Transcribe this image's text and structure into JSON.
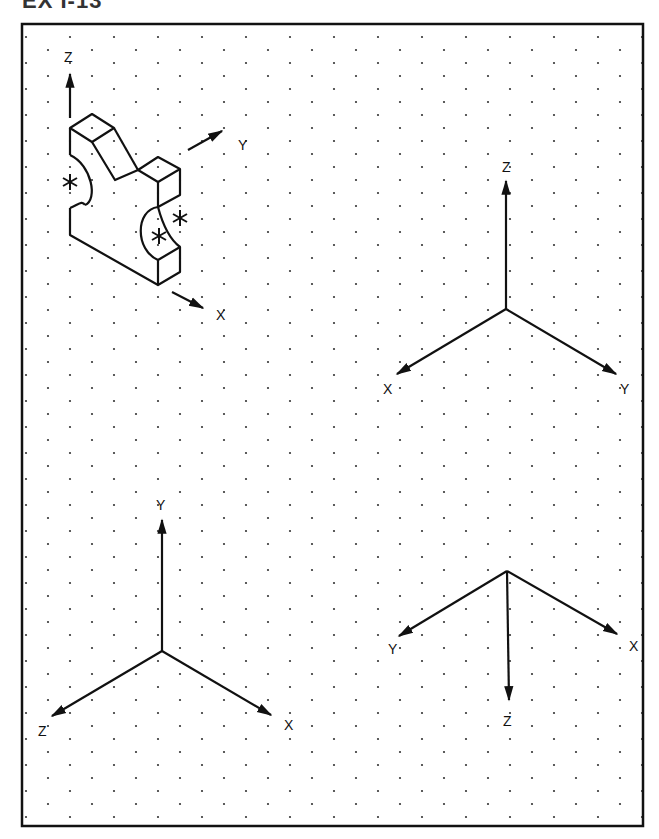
{
  "title": "EX I-13",
  "frame": {
    "x": 22,
    "y": 24,
    "width": 621,
    "height": 802,
    "stroke": "#111111"
  },
  "grid": {
    "type": "isometric-dot",
    "dx": 44,
    "dy": 13,
    "offset_x": 26,
    "offset_y": 37,
    "dot_color": "#333333"
  },
  "object": {
    "name": "isometric-part",
    "axes": {
      "z": "Z",
      "y": "Y",
      "x": "X"
    },
    "surface_markers": [
      "*",
      "*",
      "*"
    ]
  },
  "axis_sets": [
    {
      "name": "axis-set-top-right",
      "labels": {
        "up": "Z",
        "left": "X",
        "right": "Y"
      }
    },
    {
      "name": "axis-set-bottom-left",
      "labels": {
        "up": "Y",
        "left": "Z",
        "right": "X"
      }
    },
    {
      "name": "axis-set-bottom-right",
      "labels": {
        "down": "Z",
        "left": "Y",
        "right": "X"
      }
    }
  ]
}
